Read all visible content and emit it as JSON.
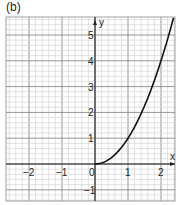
{
  "figure_label": "(b)",
  "chart_data": {
    "type": "line",
    "title": "",
    "panel_label": "(b)",
    "xlabel": "x",
    "ylabel": "y",
    "function": "y = x^2, x >= 0",
    "xlim": [
      -2.7,
      2.42
    ],
    "ylim": [
      -1.43,
      5.7
    ],
    "x_ticks": [
      -2,
      -1,
      0,
      1,
      2
    ],
    "y_ticks": [
      -1,
      1,
      2,
      3,
      4,
      5
    ],
    "x_tick_labels": [
      "−2",
      "−1",
      "0",
      "1",
      "2"
    ],
    "y_tick_labels": [
      "−1",
      "1",
      "2",
      "3",
      "4",
      "5"
    ],
    "grid": true,
    "minor_grid_step": 0.2,
    "series": [
      {
        "name": "y = x²",
        "x": [
          0,
          0.25,
          0.5,
          0.75,
          1,
          1.25,
          1.5,
          1.75,
          2,
          2.25,
          2.39
        ],
        "y": [
          0,
          0.0625,
          0.25,
          0.5625,
          1,
          1.5625,
          2.25,
          3.0625,
          4,
          5.0625,
          5.7
        ]
      }
    ],
    "legend": null
  },
  "colors": {
    "minor_grid": "#cfcfcf",
    "major_grid": "#8a8a8a",
    "axis": "#222222",
    "curve": "#111111",
    "text": "#222222"
  }
}
